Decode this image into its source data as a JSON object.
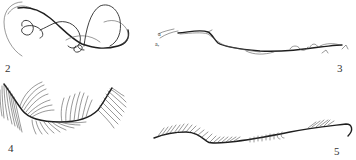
{
  "figure": {
    "background": "#ffffff",
    "ink_color": "#2a2a2a",
    "panels": [
      {
        "id": "panel-2",
        "label": "2",
        "description": "Tangled looping filament"
      },
      {
        "id": "panel-3",
        "label": "3",
        "description": "Paired strands with small annotations",
        "annotations": [
          "a",
          "a,"
        ]
      },
      {
        "id": "panel-4",
        "label": "4",
        "description": "Curved stem with dense radiating hair-like fibers"
      },
      {
        "id": "panel-5",
        "label": "5",
        "description": "Wavy strand with short fibers along one side"
      }
    ]
  }
}
